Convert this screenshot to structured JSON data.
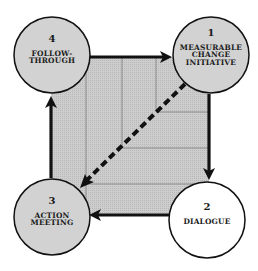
{
  "diagram": {
    "type": "cycle",
    "colors": {
      "square_fill": "#c9c9c9",
      "grid_line": "#8a8a8a",
      "border": "#111111",
      "circle_fill_gray": "#d2d2d2",
      "circle_fill_white": "#ffffff"
    },
    "nodes": [
      {
        "id": "1",
        "number": "1",
        "label_lines": [
          "MEASURABLE",
          "CHANGE",
          "INITIATIVE"
        ],
        "fill": "gray"
      },
      {
        "id": "2",
        "number": "2",
        "label_lines": [
          "DIALOGUE"
        ],
        "fill": "white"
      },
      {
        "id": "3",
        "number": "3",
        "label_lines": [
          "ACTION",
          "MEETING"
        ],
        "fill": "gray"
      },
      {
        "id": "4",
        "number": "4",
        "label_lines": [
          "FOLLOW-",
          "THROUGH"
        ],
        "fill": "gray"
      }
    ],
    "edges": [
      {
        "from": "4",
        "to": "1",
        "style": "solid"
      },
      {
        "from": "1",
        "to": "2",
        "style": "solid"
      },
      {
        "from": "2",
        "to": "3",
        "style": "solid"
      },
      {
        "from": "3",
        "to": "4",
        "style": "solid"
      },
      {
        "from": "1",
        "to": "3",
        "style": "dashed"
      }
    ],
    "labels": {
      "n1_num": "1",
      "n1_l1": "MEASURABLE",
      "n1_l2": "CHANGE",
      "n1_l3": "INITIATIVE",
      "n2_num": "2",
      "n2_l1": "DIALOGUE",
      "n3_num": "3",
      "n3_l1": "ACTION",
      "n3_l2": "MEETING",
      "n4_num": "4",
      "n4_l1": "FOLLOW-",
      "n4_l2": "THROUGH"
    }
  }
}
